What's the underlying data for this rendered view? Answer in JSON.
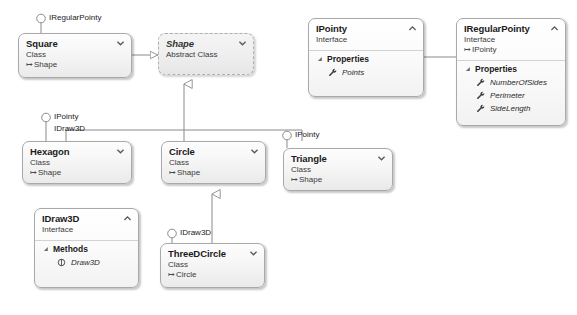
{
  "diagram": {
    "colors": {
      "box_border": "#a9a9a9",
      "box_fill_top": "#fdfdfd",
      "box_fill_bottom": "#eaeaea",
      "connector": "#808080",
      "text": "#1b1b1b"
    }
  },
  "boxes": {
    "square": {
      "title": "Square",
      "kind": "Class",
      "base": "Shape",
      "chevron": "chevron-down-icon"
    },
    "shape": {
      "title": "Shape",
      "kind": "Abstract Class",
      "chevron": "chevron-down-icon"
    },
    "ipointy": {
      "title": "IPointy",
      "kind": "Interface",
      "chevron": "chevron-up-icon",
      "groups": [
        {
          "label": "Properties",
          "members": [
            {
              "name": "Points",
              "icon": "property-wrench-icon"
            }
          ]
        }
      ]
    },
    "iregularpointy": {
      "title": "IRegularPointy",
      "kind": "Interface",
      "base": "IPointy",
      "chevron": "chevron-up-icon",
      "groups": [
        {
          "label": "Properties",
          "members": [
            {
              "name": "NumberOfSides",
              "icon": "property-wrench-icon"
            },
            {
              "name": "Perimeter",
              "icon": "property-wrench-icon"
            },
            {
              "name": "SideLength",
              "icon": "property-wrench-icon"
            }
          ]
        }
      ]
    },
    "hexagon": {
      "title": "Hexagon",
      "kind": "Class",
      "base": "Shape",
      "chevron": "chevron-down-icon"
    },
    "circle": {
      "title": "Circle",
      "kind": "Class",
      "base": "Shape",
      "chevron": "chevron-down-icon"
    },
    "triangle": {
      "title": "Triangle",
      "kind": "Class",
      "base": "Shape",
      "chevron": "chevron-down-icon"
    },
    "idraw3d": {
      "title": "IDraw3D",
      "kind": "Interface",
      "chevron": "chevron-up-icon",
      "groups": [
        {
          "label": "Methods",
          "members": [
            {
              "name": "Draw3D",
              "icon": "method-icon"
            }
          ]
        }
      ]
    },
    "threedcircle": {
      "title": "ThreeDCircle",
      "kind": "Class",
      "base": "Circle",
      "chevron": "chevron-down-icon"
    }
  },
  "lollipops": {
    "square_iregularpointy": "IRegularPointy",
    "hexagon_ipointy": "IPointy",
    "hexagon_idraw3d": "IDraw3D",
    "triangle_ipointy": "IPointy",
    "threedcircle_idraw3d": "IDraw3D"
  }
}
